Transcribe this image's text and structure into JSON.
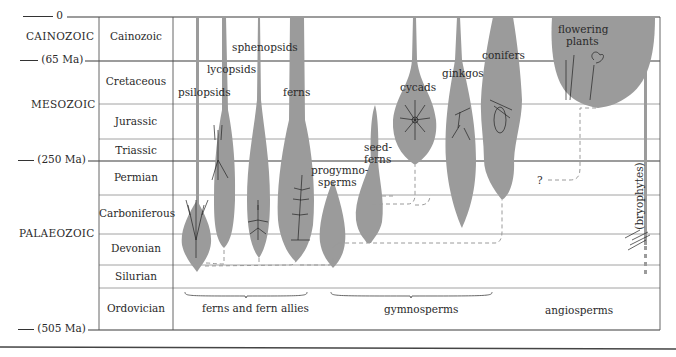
{
  "time_ticks": [
    {
      "label": "0",
      "y": 17
    },
    {
      "label": "(65 Ma)",
      "y": 61
    },
    {
      "label": "(250 Ma)",
      "y": 161
    },
    {
      "label": "(505 Ma)",
      "y": 330
    }
  ],
  "eras": [
    {
      "label": "CAINOZOIC",
      "y": 37
    },
    {
      "label": "MESOZOIC",
      "y": 105
    },
    {
      "label": "PALAEOZOIC",
      "y": 234
    }
  ],
  "periods": [
    {
      "label": "Cainozoic",
      "top": 17,
      "bottom": 61
    },
    {
      "label": "Cretaceous",
      "top": 61,
      "bottom": 104
    },
    {
      "label": "Jurassic",
      "top": 104,
      "bottom": 139
    },
    {
      "label": "Triassic",
      "top": 139,
      "bottom": 161
    },
    {
      "label": "Permian",
      "top": 161,
      "bottom": 195
    },
    {
      "label": "Carboniferous",
      "top": 195,
      "bottom": 234
    },
    {
      "label": "Devonian",
      "top": 234,
      "bottom": 265
    },
    {
      "label": "Silurian",
      "top": 265,
      "bottom": 288
    },
    {
      "label": "Ordovician",
      "top": 288,
      "bottom": 330
    }
  ],
  "lineages": [
    {
      "label": "psilopsids",
      "x": 178,
      "y": 86
    },
    {
      "label": "lycopsids",
      "x": 207,
      "y": 63
    },
    {
      "label": "sphenopsids",
      "x": 232,
      "y": 41
    },
    {
      "label": "ferns",
      "x": 283,
      "y": 86
    },
    {
      "label": "progymno-",
      "x": 311,
      "y": 166
    },
    {
      "label": "sperms",
      "x": 318,
      "y": 178
    },
    {
      "label": "seed-",
      "x": 364,
      "y": 141
    },
    {
      "label": "ferns",
      "x": 364,
      "y": 153
    },
    {
      "label": "cycads",
      "x": 400,
      "y": 83
    },
    {
      "label": "ginkgos",
      "x": 442,
      "y": 69
    },
    {
      "label": "conifers",
      "x": 482,
      "y": 51
    },
    {
      "label": "flowering",
      "x": 558,
      "y": 25
    },
    {
      "label": "plants",
      "x": 566,
      "y": 37
    },
    {
      "label": "?",
      "x": 537,
      "y": 180
    }
  ],
  "bryophytes_label": "(bryophytes)",
  "groups": [
    {
      "label": "ferns and fern allies",
      "x": 202,
      "y": 305
    },
    {
      "label": "gymnosperms",
      "x": 384,
      "y": 306
    },
    {
      "label": "angiosperms",
      "x": 545,
      "y": 307
    }
  ],
  "colors": {
    "fill": "#9b9b9b",
    "line": "#3a3a3a",
    "grid": "#8a8a8a",
    "dash": "#9a9a9a"
  }
}
